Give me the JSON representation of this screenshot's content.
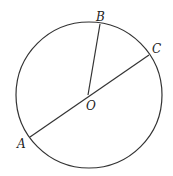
{
  "diagram": {
    "type": "circle-geometry",
    "colors": {
      "stroke": "#333333",
      "label": "#222222",
      "background": "#ffffff"
    },
    "circle": {
      "cx": 89,
      "cy": 95,
      "r": 73
    },
    "points": {
      "A": {
        "label": "A",
        "x": 30,
        "y": 137,
        "label_x": 17,
        "label_y": 148
      },
      "B": {
        "label": "B",
        "x": 100,
        "y": 24,
        "label_x": 96,
        "label_y": 21
      },
      "C": {
        "label": "C",
        "x": 149,
        "y": 55,
        "label_x": 152,
        "label_y": 53
      },
      "O": {
        "label": "O",
        "x": 88,
        "y": 95,
        "label_x": 86,
        "label_y": 110
      }
    },
    "segments": [
      {
        "name": "diameter-AC",
        "from": "A",
        "to": "C"
      },
      {
        "name": "radius-OB",
        "from": "O",
        "to": "B"
      }
    ]
  }
}
